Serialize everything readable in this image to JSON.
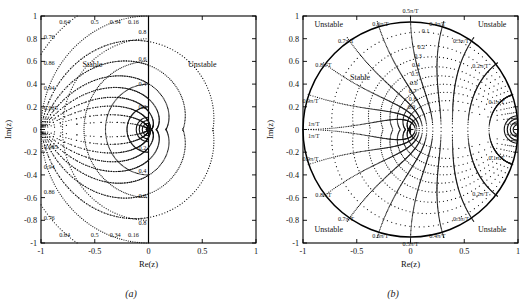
{
  "figure": {
    "panels": [
      {
        "id": "a",
        "caption": "(a)",
        "xlabel": "Re(z)",
        "ylabel": "Im(z)",
        "xticks": [
          "-1",
          "-0.5",
          "0",
          "0.5",
          "1"
        ],
        "yticks": [
          "1",
          "0.8",
          "0.6",
          "0.4",
          "0.2",
          "0",
          "-0.2",
          "-0.4",
          "-0.6",
          "-0.8",
          "-1"
        ],
        "regions": [
          {
            "name": "stable",
            "label": "Stable"
          },
          {
            "name": "unstable",
            "label": "Unstable"
          }
        ],
        "damping_top_labels": [
          "0.64",
          "0.5",
          "0.34",
          "0.16"
        ],
        "damping_left_labels": [
          "0.76",
          "0.86",
          "0.94",
          "0.985"
        ],
        "damping_left_labels_lower": [
          "0.985",
          "0.94",
          "0.86",
          "0.76"
        ],
        "damping_bottom_labels": [
          "0.64",
          "0.5",
          "0.34",
          "0.16"
        ],
        "freq_right_labels_upper": [
          "0.8",
          "0.6",
          "0.4",
          "0.2"
        ],
        "freq_right_labels_lower": [
          "0.2",
          "0.4",
          "0.6",
          "0.8"
        ]
      },
      {
        "id": "b",
        "caption": "(b)",
        "xlabel": "Re(z)",
        "ylabel": "Im(z)",
        "xticks": [
          "-1",
          "-0.5",
          "0",
          "0.5",
          "1"
        ],
        "yticks": [
          "1",
          "0.8",
          "0.6",
          "0.4",
          "0.2",
          "0",
          "-0.2",
          "-0.4",
          "-0.6",
          "-0.8",
          "-1"
        ],
        "regions": [
          {
            "name": "stable",
            "label": "Stable"
          },
          {
            "name": "unstable-tl",
            "label": "Unstable"
          },
          {
            "name": "unstable-tr",
            "label": "Unstable"
          },
          {
            "name": "unstable-bl",
            "label": "Unstable"
          },
          {
            "name": "unstable-br",
            "label": "Unstable"
          }
        ],
        "damping_labels": [
          "0.1",
          "0.2",
          "0.3",
          "0.4",
          "0.5",
          "0.6",
          "0.7",
          "0.8",
          "0.9"
        ],
        "freq_labels_upper": [
          "0.5π/T",
          "0.6π/T",
          "0.4π/T",
          "0.7π/T",
          "0.3π/T",
          "0.8π/T",
          "0.2π/T",
          "0.9π/T",
          "0.1π/T",
          "1π/T"
        ],
        "freq_labels_lower": [
          "0.5π/T",
          "0.6π/T",
          "0.4π/T",
          "0.7π/T",
          "0.3π/T",
          "0.8π/T",
          "0.2π/T",
          "0.9π/T",
          "0.1π/T",
          "1π/T"
        ]
      }
    ]
  },
  "chart_data": {
    "type": "scatter",
    "title": "",
    "xlabel": "Re(z)",
    "ylabel": "Im(z)",
    "xlim": [
      -1,
      1
    ],
    "ylim": [
      -1,
      1
    ],
    "grid": false,
    "legend": "none",
    "panels": [
      {
        "id": "a",
        "caption": "(a)",
        "description": "z-plane constant damping-ratio and constant natural-frequency loci drawn only in the left half plane; the region Re(z)<0 is marked Stable and Re(z)>0 is marked Unstable.",
        "stability_boundary": {
          "type": "vertical-line",
          "x": 0
        },
        "damping_ratio_contours": [
          0.16,
          0.34,
          0.5,
          0.64,
          0.76,
          0.86,
          0.94,
          0.985
        ],
        "natural_frequency_contours": [
          0.2,
          0.4,
          0.6,
          0.8
        ],
        "damping_label_positions_top": [
          {
            "label": "0.64",
            "x": -0.78,
            "y": 0.95
          },
          {
            "label": "0.5",
            "x": -0.5,
            "y": 0.95
          },
          {
            "label": "0.34",
            "x": -0.31,
            "y": 0.95
          },
          {
            "label": "0.16",
            "x": -0.14,
            "y": 0.95
          }
        ],
        "damping_label_positions_left": [
          {
            "label": "0.76",
            "x": -0.96,
            "y": 0.82
          },
          {
            "label": "0.86",
            "x": -0.96,
            "y": 0.59
          },
          {
            "label": "0.94",
            "x": -0.96,
            "y": 0.36
          },
          {
            "label": "0.985",
            "x": -0.96,
            "y": 0.17
          }
        ],
        "frequency_label_positions": [
          {
            "label": "0.8",
            "x": -0.06,
            "y": 0.83
          },
          {
            "label": "0.6",
            "x": -0.06,
            "y": 0.6
          },
          {
            "label": "0.4",
            "x": -0.07,
            "y": 0.38
          },
          {
            "label": "0.2",
            "x": -0.08,
            "y": 0.17
          }
        ]
      },
      {
        "id": "b",
        "caption": "(b)",
        "description": "Unit-circle z-plane grid: constant damping-ratio spirals 0.1 to 0.9 and constant natural-frequency radials 0.1 pi/T to 1 pi/T; inside the unit circle is Stable, outside in each corner is marked Unstable.",
        "stability_boundary": {
          "type": "unit-circle",
          "radius": 1,
          "center": [
            0,
            0
          ]
        },
        "damping_ratio_contours": [
          0.1,
          0.2,
          0.3,
          0.4,
          0.5,
          0.6,
          0.7,
          0.8,
          0.9
        ],
        "natural_frequency_contours": [
          "0.1π/T",
          "0.2π/T",
          "0.3π/T",
          "0.4π/T",
          "0.5π/T",
          "0.6π/T",
          "0.7π/T",
          "0.8π/T",
          "0.9π/T",
          "1π/T"
        ],
        "damping_label_positions": [
          {
            "label": "0.1",
            "x": 0.14,
            "y": 0.85
          },
          {
            "label": "0.2",
            "x": 0.1,
            "y": 0.71
          },
          {
            "label": "0.3",
            "x": 0.07,
            "y": 0.63
          },
          {
            "label": "0.4",
            "x": 0.05,
            "y": 0.55
          },
          {
            "label": "0.5",
            "x": 0.04,
            "y": 0.47
          },
          {
            "label": "0.6",
            "x": 0.03,
            "y": 0.39
          },
          {
            "label": "0.7",
            "x": 0.02,
            "y": 0.32
          },
          {
            "label": "0.8",
            "x": 0.02,
            "y": 0.25
          },
          {
            "label": "0.9",
            "x": 0.01,
            "y": 0.18
          }
        ]
      }
    ]
  }
}
